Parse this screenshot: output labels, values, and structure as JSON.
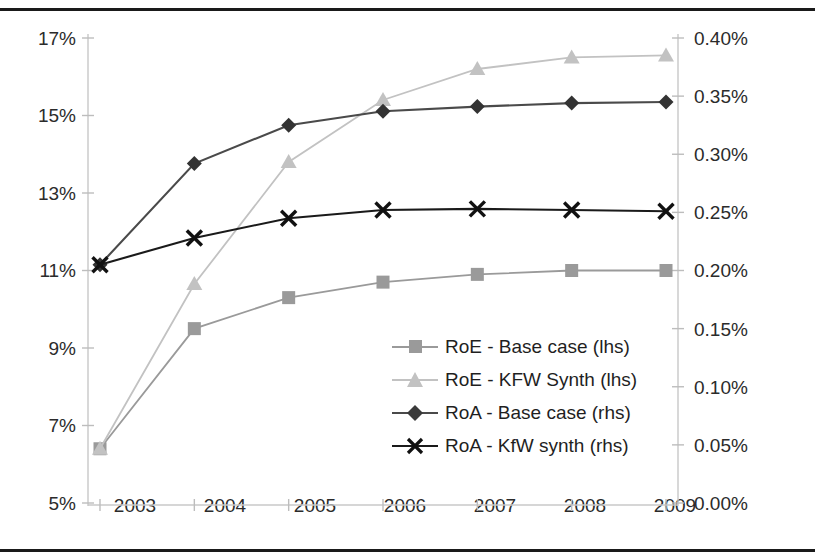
{
  "chart_data": {
    "type": "line",
    "title": "",
    "xlabel": "",
    "ylabel": "",
    "categories": [
      "2003",
      "2004",
      "2005",
      "2006",
      "2007",
      "2008",
      "2009"
    ],
    "x_tick_labels": [
      "2003",
      "2004",
      "2005",
      "2006",
      "2007",
      "2008",
      "2009"
    ],
    "left_axis": {
      "label": "",
      "ylim": [
        5,
        17
      ],
      "tick_values": [
        5,
        7,
        9,
        11,
        13,
        15,
        17
      ],
      "tick_labels": [
        "5%",
        "7%",
        "9%",
        "11%",
        "13%",
        "15%",
        "17%"
      ],
      "unit": "%"
    },
    "right_axis": {
      "label": "",
      "ylim": [
        0.0,
        0.4
      ],
      "tick_values": [
        0.0,
        0.05,
        0.1,
        0.15,
        0.2,
        0.25,
        0.3,
        0.35,
        0.4
      ],
      "tick_labels": [
        "0.00%",
        "0.05%",
        "0.10%",
        "0.15%",
        "0.20%",
        "0.25%",
        "0.30%",
        "0.35%",
        "0.40%"
      ],
      "unit": "%"
    },
    "grid": false,
    "legend_position": "center-right-inside",
    "series": [
      {
        "name": "RoE - Base case (lhs)",
        "axis": "left",
        "marker": "square",
        "color": "#9a9a9a",
        "values": [
          6.4,
          9.5,
          10.3,
          10.7,
          10.9,
          11.0,
          11.0
        ]
      },
      {
        "name": "RoE - KFW Synth (lhs)",
        "axis": "left",
        "marker": "triangle",
        "color": "#c2c2c2",
        "values": [
          6.4,
          10.65,
          13.8,
          15.4,
          16.2,
          16.5,
          16.55
        ]
      },
      {
        "name": "RoA - Base case (rhs)",
        "axis": "right",
        "marker": "diamond",
        "color": "#4a4a4a",
        "values": [
          0.205,
          0.292,
          0.325,
          0.337,
          0.341,
          0.344,
          0.345
        ]
      },
      {
        "name": "RoA - KfW synth (rhs)",
        "axis": "right",
        "marker": "cross",
        "color": "#1a1a1a",
        "values": [
          0.205,
          0.228,
          0.245,
          0.252,
          0.253,
          0.252,
          0.251
        ]
      }
    ]
  },
  "legend": {
    "items": [
      {
        "label": "RoE - Base case (lhs)",
        "marker": "square",
        "color": "#9a9a9a"
      },
      {
        "label": "RoE - KFW Synth (lhs)",
        "marker": "triangle",
        "color": "#c2c2c2"
      },
      {
        "label": "RoA - Base case (rhs)",
        "marker": "diamond",
        "color": "#4a4a4a"
      },
      {
        "label": "RoA - KfW synth (rhs)",
        "marker": "cross",
        "color": "#1a1a1a"
      }
    ]
  }
}
